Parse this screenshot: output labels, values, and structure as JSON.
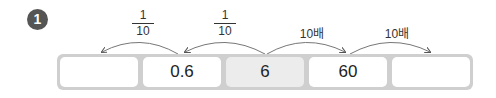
{
  "problem": {
    "number": "1"
  },
  "cells": [
    {
      "value": "",
      "shaded": false
    },
    {
      "value": "0.6",
      "shaded": false
    },
    {
      "value": "6",
      "shaded": true
    },
    {
      "value": "60",
      "shaded": false
    },
    {
      "value": "",
      "shaded": false
    }
  ],
  "arrows": [
    {
      "label_num": "1",
      "label_den": "10",
      "direction": "left"
    },
    {
      "label_num": "1",
      "label_den": "10",
      "direction": "left"
    },
    {
      "label": "10배",
      "direction": "right"
    },
    {
      "label": "10배",
      "direction": "right"
    }
  ],
  "colors": {
    "badge": "#555555",
    "strip": "#cfcfcf",
    "shaded_cell": "#ececec"
  }
}
